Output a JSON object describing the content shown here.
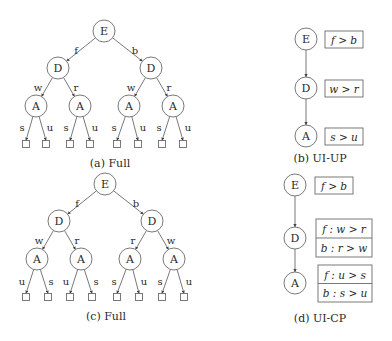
{
  "colors": {
    "stroke": "#6a6a6a",
    "edge": "#555555",
    "text": "#2a2a2a",
    "background": "#ffffff"
  },
  "panels": [
    {
      "id": "a",
      "caption": "(a) Full",
      "caption_pos": [
        110,
        163
      ],
      "type": "tree",
      "node_radius": 11,
      "nodes": [
        {
          "id": "E",
          "label": "E",
          "x": 104,
          "y": 31
        },
        {
          "id": "D1",
          "label": "D",
          "x": 58,
          "y": 68
        },
        {
          "id": "D2",
          "label": "D",
          "x": 151,
          "y": 68
        },
        {
          "id": "A1",
          "label": "A",
          "x": 36,
          "y": 106
        },
        {
          "id": "A2",
          "label": "A",
          "x": 80,
          "y": 106
        },
        {
          "id": "A3",
          "label": "A",
          "x": 129,
          "y": 106
        },
        {
          "id": "A4",
          "label": "A",
          "x": 173,
          "y": 106
        }
      ],
      "leaves": [
        {
          "id": "L1",
          "x": 26,
          "y": 144
        },
        {
          "id": "L2",
          "x": 46,
          "y": 144
        },
        {
          "id": "L3",
          "x": 70,
          "y": 144
        },
        {
          "id": "L4",
          "x": 90,
          "y": 144
        },
        {
          "id": "L5",
          "x": 117,
          "y": 144
        },
        {
          "id": "L6",
          "x": 138,
          "y": 144
        },
        {
          "id": "L7",
          "x": 162,
          "y": 144
        },
        {
          "id": "L8",
          "x": 183,
          "y": 144
        }
      ],
      "edges": [
        {
          "from": "E",
          "to": "D1",
          "label": "f",
          "lx": 76,
          "ly": 50
        },
        {
          "from": "E",
          "to": "D2",
          "label": "b",
          "lx": 135,
          "ly": 50
        },
        {
          "from": "D1",
          "to": "A1",
          "label": "w",
          "lx": 38,
          "ly": 87
        },
        {
          "from": "D1",
          "to": "A2",
          "label": "r",
          "lx": 76,
          "ly": 87
        },
        {
          "from": "D2",
          "to": "A3",
          "label": "w",
          "lx": 131,
          "ly": 87
        },
        {
          "from": "D2",
          "to": "A4",
          "label": "r",
          "lx": 169,
          "ly": 87
        },
        {
          "from": "A1",
          "to": "L1",
          "label": "s",
          "lx": 22,
          "ly": 127
        },
        {
          "from": "A1",
          "to": "L2",
          "label": "u",
          "lx": 50,
          "ly": 127
        },
        {
          "from": "A2",
          "to": "L3",
          "label": "s",
          "lx": 66,
          "ly": 127
        },
        {
          "from": "A2",
          "to": "L4",
          "label": "u",
          "lx": 95,
          "ly": 127
        },
        {
          "from": "A3",
          "to": "L5",
          "label": "s",
          "lx": 114,
          "ly": 127
        },
        {
          "from": "A3",
          "to": "L6",
          "label": "u",
          "lx": 143,
          "ly": 127
        },
        {
          "from": "A4",
          "to": "L7",
          "label": "s",
          "lx": 159,
          "ly": 127
        },
        {
          "from": "A4",
          "to": "L8",
          "label": "u",
          "lx": 188,
          "ly": 127
        }
      ]
    },
    {
      "id": "c",
      "caption": "(c) Full",
      "caption_pos": [
        106,
        316
      ],
      "type": "tree",
      "node_radius": 11,
      "nodes": [
        {
          "id": "E",
          "label": "E",
          "x": 105,
          "y": 184
        },
        {
          "id": "D1",
          "label": "D",
          "x": 59,
          "y": 221
        },
        {
          "id": "D2",
          "label": "D",
          "x": 152,
          "y": 221
        },
        {
          "id": "A1",
          "label": "A",
          "x": 37,
          "y": 259
        },
        {
          "id": "A2",
          "label": "A",
          "x": 81,
          "y": 259
        },
        {
          "id": "A3",
          "label": "A",
          "x": 130,
          "y": 259
        },
        {
          "id": "A4",
          "label": "A",
          "x": 174,
          "y": 259
        }
      ],
      "leaves": [
        {
          "id": "L1",
          "x": 26,
          "y": 297
        },
        {
          "id": "L2",
          "x": 48,
          "y": 297
        },
        {
          "id": "L3",
          "x": 70,
          "y": 297
        },
        {
          "id": "L4",
          "x": 92,
          "y": 297
        },
        {
          "id": "L5",
          "x": 117,
          "y": 297
        },
        {
          "id": "L6",
          "x": 139,
          "y": 297
        },
        {
          "id": "L7",
          "x": 162,
          "y": 297
        },
        {
          "id": "L8",
          "x": 184,
          "y": 297
        }
      ],
      "edges": [
        {
          "from": "E",
          "to": "D1",
          "label": "f",
          "lx": 77,
          "ly": 203
        },
        {
          "from": "E",
          "to": "D2",
          "label": "b",
          "lx": 136,
          "ly": 203
        },
        {
          "from": "D1",
          "to": "A1",
          "label": "w",
          "lx": 39,
          "ly": 240
        },
        {
          "from": "D1",
          "to": "A2",
          "label": "r",
          "lx": 77,
          "ly": 240
        },
        {
          "from": "D2",
          "to": "A3",
          "label": "r",
          "lx": 133,
          "ly": 240
        },
        {
          "from": "D2",
          "to": "A4",
          "label": "w",
          "lx": 171,
          "ly": 240
        },
        {
          "from": "A1",
          "to": "L1",
          "label": "u",
          "lx": 22,
          "ly": 281
        },
        {
          "from": "A1",
          "to": "L2",
          "label": "s",
          "lx": 51,
          "ly": 281
        },
        {
          "from": "A2",
          "to": "L3",
          "label": "u",
          "lx": 66,
          "ly": 281
        },
        {
          "from": "A2",
          "to": "L4",
          "label": "s",
          "lx": 96,
          "ly": 281
        },
        {
          "from": "A3",
          "to": "L5",
          "label": "s",
          "lx": 114,
          "ly": 281
        },
        {
          "from": "A3",
          "to": "L6",
          "label": "u",
          "lx": 144,
          "ly": 281
        },
        {
          "from": "A4",
          "to": "L7",
          "label": "s",
          "lx": 160,
          "ly": 281
        },
        {
          "from": "A4",
          "to": "L8",
          "label": "u",
          "lx": 189,
          "ly": 281
        }
      ]
    },
    {
      "id": "b",
      "caption": "(b) UI-UP",
      "caption_pos": [
        320,
        158
      ],
      "type": "chain",
      "node_radius": 11,
      "nodes": [
        {
          "id": "E",
          "label": "E",
          "x": 306,
          "y": 39,
          "box": {
            "x": 325,
            "y": 31,
            "w": 38,
            "h": 17,
            "rows": [
              "f > b"
            ]
          }
        },
        {
          "id": "D",
          "label": "D",
          "x": 306,
          "y": 88,
          "box": {
            "x": 325,
            "y": 80,
            "w": 38,
            "h": 17,
            "rows": [
              "w > r"
            ]
          }
        },
        {
          "id": "A",
          "label": "A",
          "x": 306,
          "y": 136,
          "box": {
            "x": 325,
            "y": 128,
            "w": 38,
            "h": 17,
            "rows": [
              "s > u"
            ]
          }
        }
      ],
      "edges": [
        {
          "from": "E",
          "to": "D"
        },
        {
          "from": "D",
          "to": "A"
        }
      ]
    },
    {
      "id": "d",
      "caption": "(d) UI-CP",
      "caption_pos": [
        320,
        318
      ],
      "type": "chain",
      "node_radius": 11,
      "nodes": [
        {
          "id": "E",
          "label": "E",
          "x": 295,
          "y": 185,
          "box": {
            "x": 315,
            "y": 177,
            "w": 38,
            "h": 17,
            "rows": [
              "f > b"
            ]
          }
        },
        {
          "id": "D",
          "label": "D",
          "x": 295,
          "y": 238,
          "box": {
            "x": 316,
            "y": 219,
            "w": 56,
            "h": 38,
            "rows": [
              "f : w > r",
              "b : r > w"
            ]
          }
        },
        {
          "id": "A",
          "label": "A",
          "x": 295,
          "y": 283,
          "box": {
            "x": 318,
            "y": 265,
            "w": 54,
            "h": 37,
            "rows": [
              "f : u > s",
              "b : s > u"
            ]
          }
        }
      ],
      "edges": [
        {
          "from": "E",
          "to": "D"
        },
        {
          "from": "D",
          "to": "A"
        }
      ]
    }
  ]
}
